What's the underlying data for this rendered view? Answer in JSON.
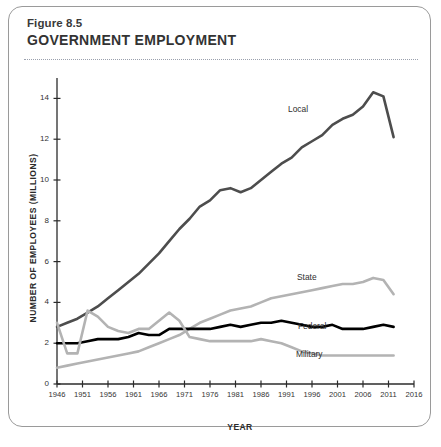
{
  "figure": {
    "number": "Figure 8.5",
    "title": "GOVERNMENT EMPLOYMENT"
  },
  "chart_data": {
    "type": "line",
    "title": "GOVERNMENT EMPLOYMENT",
    "subtitle": "Figure 8.5",
    "xlabel": "YEAR",
    "ylabel": "NUMBER OF EMPLOYEES (MILLIONS)",
    "xlim": [
      1946,
      2016
    ],
    "ylim": [
      0,
      15
    ],
    "xticks": [
      1946,
      1951,
      1956,
      1961,
      1966,
      1971,
      1976,
      1981,
      1986,
      1991,
      1996,
      2001,
      2006,
      2011,
      2016
    ],
    "yticks": [
      0,
      2,
      4,
      6,
      8,
      10,
      12,
      14
    ],
    "grid": false,
    "legend": "inline-labels",
    "colors": {
      "local": "#4d4d4d",
      "state": "#b3b3b3",
      "federal": "#000000",
      "military": "#b3b3b3"
    },
    "series": [
      {
        "name": "Local",
        "color": "#4d4d4d",
        "x": [
          1946,
          1948,
          1950,
          1952,
          1954,
          1956,
          1958,
          1960,
          1962,
          1964,
          1966,
          1968,
          1970,
          1972,
          1974,
          1976,
          1978,
          1980,
          1982,
          1984,
          1986,
          1988,
          1990,
          1992,
          1994,
          1996,
          1998,
          2000,
          2002,
          2004,
          2006,
          2008,
          2010,
          2012
        ],
        "y": [
          2.8,
          3.0,
          3.2,
          3.5,
          3.8,
          4.2,
          4.6,
          5.0,
          5.4,
          5.9,
          6.4,
          7.0,
          7.6,
          8.1,
          8.7,
          9.0,
          9.5,
          9.6,
          9.4,
          9.6,
          10.0,
          10.4,
          10.8,
          11.1,
          11.6,
          11.9,
          12.2,
          12.7,
          13.0,
          13.2,
          13.6,
          14.3,
          14.1,
          12.1
        ]
      },
      {
        "name": "State",
        "color": "#b3b3b3",
        "x": [
          1946,
          1948,
          1950,
          1952,
          1954,
          1956,
          1958,
          1960,
          1962,
          1964,
          1966,
          1968,
          1970,
          1972,
          1974,
          1976,
          1978,
          1980,
          1982,
          1984,
          1986,
          1988,
          1990,
          1992,
          1994,
          1996,
          1998,
          2000,
          2002,
          2004,
          2006,
          2008,
          2010,
          2012
        ],
        "y": [
          0.8,
          0.9,
          1.0,
          1.1,
          1.2,
          1.3,
          1.4,
          1.5,
          1.6,
          1.8,
          2.0,
          2.2,
          2.4,
          2.7,
          3.0,
          3.2,
          3.4,
          3.6,
          3.7,
          3.8,
          4.0,
          4.2,
          4.3,
          4.4,
          4.5,
          4.6,
          4.7,
          4.8,
          4.9,
          4.9,
          5.0,
          5.2,
          5.1,
          4.4
        ]
      },
      {
        "name": "Federal",
        "color": "#000000",
        "x": [
          1946,
          1948,
          1950,
          1952,
          1954,
          1956,
          1958,
          1960,
          1962,
          1964,
          1966,
          1968,
          1970,
          1972,
          1974,
          1976,
          1978,
          1980,
          1982,
          1984,
          1986,
          1988,
          1990,
          1992,
          1994,
          1996,
          1998,
          2000,
          2002,
          2004,
          2006,
          2008,
          2010,
          2012
        ],
        "y": [
          2.0,
          2.0,
          2.0,
          2.1,
          2.2,
          2.2,
          2.2,
          2.3,
          2.5,
          2.4,
          2.4,
          2.7,
          2.7,
          2.7,
          2.7,
          2.7,
          2.8,
          2.9,
          2.8,
          2.9,
          3.0,
          3.0,
          3.1,
          3.0,
          2.9,
          2.8,
          2.8,
          2.9,
          2.7,
          2.7,
          2.7,
          2.8,
          2.9,
          2.8
        ]
      },
      {
        "name": "Military",
        "color": "#b3b3b3",
        "x": [
          1946,
          1948,
          1950,
          1952,
          1954,
          1956,
          1958,
          1960,
          1962,
          1964,
          1966,
          1968,
          1970,
          1972,
          1974,
          1976,
          1978,
          1980,
          1982,
          1984,
          1986,
          1988,
          1990,
          1992,
          1994,
          1996,
          1998,
          2000,
          2002,
          2004,
          2006,
          2008,
          2010,
          2012
        ],
        "y": [
          3.0,
          1.5,
          1.5,
          3.6,
          3.3,
          2.8,
          2.6,
          2.5,
          2.7,
          2.7,
          3.1,
          3.5,
          3.1,
          2.3,
          2.2,
          2.1,
          2.1,
          2.1,
          2.1,
          2.1,
          2.2,
          2.1,
          2.0,
          1.8,
          1.6,
          1.5,
          1.4,
          1.4,
          1.4,
          1.4,
          1.4,
          1.4,
          1.4,
          1.4
        ]
      }
    ]
  },
  "axis": {
    "y_title": "NUMBER OF EMPLOYEES (MILLIONS)",
    "x_title": "YEAR",
    "y_ticks": [
      "0",
      "2",
      "4",
      "6",
      "8",
      "10",
      "12",
      "14"
    ],
    "x_ticks": [
      "1946",
      "1951",
      "1956",
      "1961",
      "1966",
      "1971",
      "1976",
      "1981",
      "1986",
      "1991",
      "1996",
      "2001",
      "2006",
      "2011",
      "2016"
    ]
  },
  "series_labels": {
    "local": "Local",
    "state": "State",
    "federal": "Federal",
    "military": "Military"
  }
}
